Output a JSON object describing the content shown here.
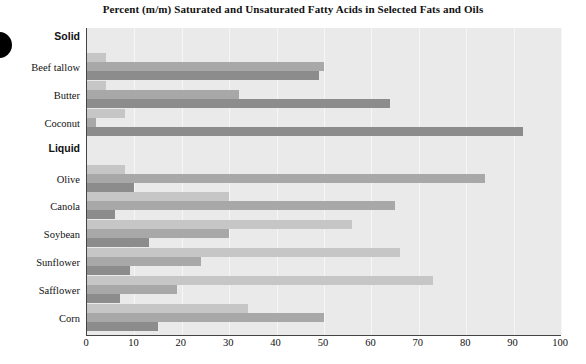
{
  "chart_data": {
    "type": "bar",
    "orientation": "horizontal",
    "title": "Percent (m/m) Saturated and Unsaturated Fatty Acids in Selected Fats and Oils",
    "xlabel": "",
    "ylabel": "",
    "xlim": [
      0,
      100
    ],
    "xticks": [
      0,
      10,
      20,
      30,
      40,
      50,
      60,
      70,
      80,
      90,
      100
    ],
    "grid": true,
    "legend_position": "none",
    "group_headers": [
      "Solid",
      "Liquid"
    ],
    "categories": [
      "Beef tallow",
      "Butter",
      "Coconut",
      "Olive",
      "Canola",
      "Soybean",
      "Sunflower",
      "Safflower",
      "Corn"
    ],
    "groups": [
      {
        "header": "Solid",
        "categories": [
          "Beef tallow",
          "Butter",
          "Coconut"
        ]
      },
      {
        "header": "Liquid",
        "categories": [
          "Olive",
          "Canola",
          "Soybean",
          "Sunflower",
          "Safflower",
          "Corn"
        ]
      }
    ],
    "series": [
      {
        "name": "series-1",
        "color": "#c6c6c6",
        "values": [
          4,
          4,
          8,
          8,
          30,
          56,
          66,
          73,
          34
        ]
      },
      {
        "name": "series-2",
        "color": "#a8a8a8",
        "values": [
          50,
          32,
          2,
          84,
          65,
          30,
          24,
          19,
          50
        ]
      },
      {
        "name": "series-3",
        "color": "#8c8c8c",
        "values": [
          49,
          64,
          92,
          10,
          6,
          13,
          9,
          7,
          15
        ]
      }
    ]
  },
  "rows": [
    {
      "kind": "header",
      "label": "Solid"
    },
    {
      "kind": "bars",
      "label": "Beef tallow",
      "values": [
        4,
        50,
        49
      ]
    },
    {
      "kind": "bars",
      "label": "Butter",
      "values": [
        4,
        32,
        64
      ]
    },
    {
      "kind": "bars",
      "label": "Coconut",
      "values": [
        8,
        2,
        92
      ]
    },
    {
      "kind": "header",
      "label": "Liquid"
    },
    {
      "kind": "bars",
      "label": "Olive",
      "values": [
        8,
        84,
        10
      ]
    },
    {
      "kind": "bars",
      "label": "Canola",
      "values": [
        30,
        65,
        6
      ]
    },
    {
      "kind": "bars",
      "label": "Soybean",
      "values": [
        56,
        30,
        13
      ]
    },
    {
      "kind": "bars",
      "label": "Sunflower",
      "values": [
        66,
        24,
        9
      ]
    },
    {
      "kind": "bars",
      "label": "Safflower",
      "values": [
        73,
        19,
        7
      ]
    },
    {
      "kind": "bars",
      "label": "Corn",
      "values": [
        34,
        50,
        15
      ]
    }
  ],
  "axis": {
    "ticks": [
      "0",
      "10",
      "20",
      "30",
      "40",
      "50",
      "60",
      "70",
      "80",
      "90",
      "100"
    ]
  }
}
